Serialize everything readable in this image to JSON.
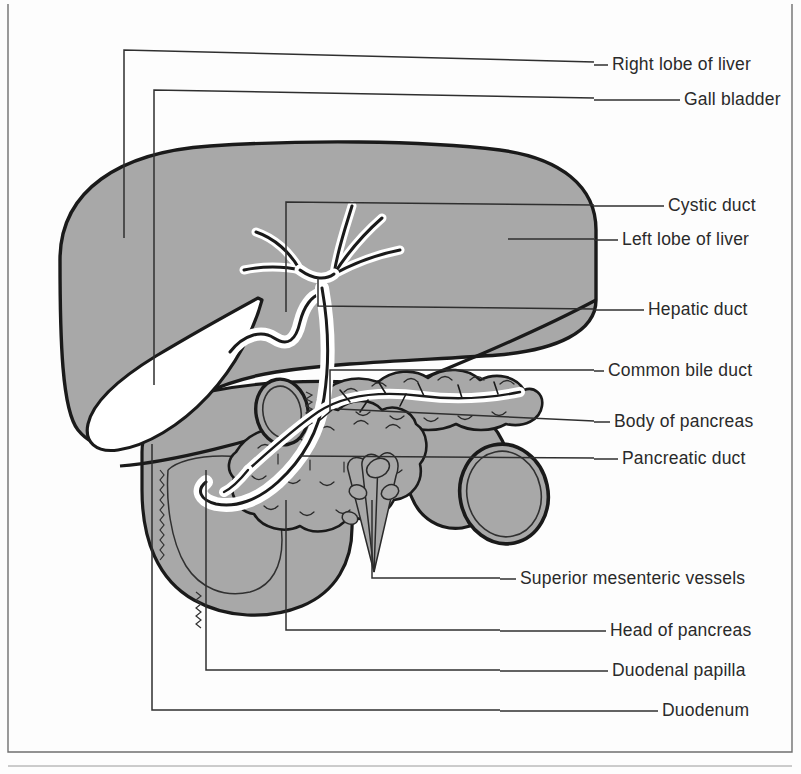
{
  "figure": {
    "caption": "",
    "background_color": "#fdfdfd",
    "organ_fill": "#a8a8a8",
    "duct_fill": "#ffffff",
    "outline_color": "#1a1a1a",
    "leader_color": "#2f2f2f",
    "label_color": "#2a2a2a"
  },
  "border": {
    "left_x": 8,
    "top_y": 4,
    "right_x": 792,
    "bottom_y": 752,
    "stroke": "#6f6f6f"
  },
  "labels": [
    {
      "id": "right-lobe-of-liver",
      "text": "Right lobe of liver",
      "text_x": 612,
      "text_y": 70,
      "dash_x1": 594,
      "dash_x2": 608
    },
    {
      "id": "gall-bladder",
      "text": "Gall bladder",
      "text_x": 684,
      "text_y": 105,
      "dash_x1": 594,
      "dash_x2": 680
    },
    {
      "id": "cystic-duct",
      "text": "Cystic duct",
      "text_x": 668,
      "text_y": 211,
      "dash_x1": 594,
      "dash_x2": 664
    },
    {
      "id": "left-lobe-of-liver",
      "text": "Left lobe of liver",
      "text_x": 622,
      "text_y": 245,
      "dash_x1": 594,
      "dash_x2": 618
    },
    {
      "id": "hepatic-duct",
      "text": "Hepatic duct",
      "text_x": 648,
      "text_y": 315,
      "dash_x1": 594,
      "dash_x2": 644
    },
    {
      "id": "common-bile-duct",
      "text": "Common bile duct",
      "text_x": 608,
      "text_y": 376,
      "dash_x1": 594,
      "dash_x2": 604
    },
    {
      "id": "body-of-pancreas",
      "text": "Body of pancreas",
      "text_x": 614,
      "text_y": 427,
      "dash_x1": 594,
      "dash_x2": 610
    },
    {
      "id": "pancreatic-duct",
      "text": "Pancreatic duct",
      "text_x": 622,
      "text_y": 464,
      "dash_x1": 594,
      "dash_x2": 618
    },
    {
      "id": "superior-mesenteric-vessels",
      "text": "Superior mesenteric vessels",
      "text_x": 520,
      "text_y": 584,
      "dash_x1": 500,
      "dash_x2": 516
    },
    {
      "id": "head-of-pancreas",
      "text": "Head of pancreas",
      "text_x": 610,
      "text_y": 636,
      "dash_x1": 500,
      "dash_x2": 606
    },
    {
      "id": "duodenal-papilla",
      "text": "Duodenal papilla",
      "text_x": 612,
      "text_y": 676,
      "dash_x1": 500,
      "dash_x2": 608
    },
    {
      "id": "duodenum",
      "text": "Duodenum",
      "text_x": 662,
      "text_y": 716,
      "dash_x1": 500,
      "dash_x2": 658
    }
  ],
  "leaders": [
    {
      "id": "leader-right-lobe-of-liver",
      "points": "594,62 124,50 124,238"
    },
    {
      "id": "leader-gall-bladder",
      "points": "594,98 154,90 154,385"
    },
    {
      "id": "leader-cystic-duct",
      "points": "594,205 286,202 286,312"
    },
    {
      "id": "leader-left-lobe-of-liver",
      "points": "594,239 508,239"
    },
    {
      "id": "leader-hepatic-duct",
      "points": "594,309 318,306 318,278"
    },
    {
      "id": "leader-common-bile-duct",
      "points": "594,370 330,370 330,412"
    },
    {
      "id": "leader-body-of-pancreas",
      "points": "594,421 338,409"
    },
    {
      "id": "leader-pancreatic-duct",
      "points": "594,458 300,456"
    },
    {
      "id": "leader-superior-mesenteric-vessels",
      "points": "500,578 372,578 372,500"
    },
    {
      "id": "leader-head-of-pancreas",
      "points": "500,630 286,630 286,500"
    },
    {
      "id": "leader-duodenal-papilla",
      "points": "500,670 206,670 206,470"
    },
    {
      "id": "leader-duodenum",
      "points": "500,710 152,710 152,444"
    }
  ],
  "organs": [
    {
      "id": "liver",
      "label": "Liver (right and left lobes)"
    },
    {
      "id": "gallbladder",
      "label": "Gall bladder"
    },
    {
      "id": "hepatic-duct",
      "label": "Hepatic duct"
    },
    {
      "id": "cystic-duct",
      "label": "Cystic duct"
    },
    {
      "id": "common-bile-duct",
      "label": "Common bile duct"
    },
    {
      "id": "pancreas",
      "label": "Pancreas (head and body)"
    },
    {
      "id": "pancreatic-duct",
      "label": "Pancreatic duct"
    },
    {
      "id": "duodenum",
      "label": "Duodenum"
    },
    {
      "id": "sm-vessels",
      "label": "Superior mesenteric vessels"
    }
  ]
}
